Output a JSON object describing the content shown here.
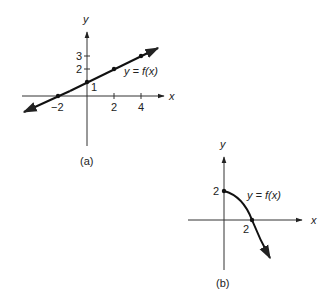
{
  "figure_a": {
    "caption": "(a)",
    "x_axis_label": "x",
    "y_axis_label": "y",
    "x_ticks": [
      "−2",
      "2",
      "4"
    ],
    "y_ticks": [
      "1",
      "2",
      "3"
    ],
    "curve_label": "y = f(x)",
    "points": [
      [
        -2,
        0
      ],
      [
        0,
        1
      ],
      [
        2,
        2
      ],
      [
        4,
        3
      ]
    ]
  },
  "figure_b": {
    "caption": "(b)",
    "x_axis_label": "x",
    "y_axis_label": "y",
    "x_tick": "2",
    "y_tick": "2",
    "curve_label": "y = f(x)",
    "points": [
      [
        0,
        2
      ],
      [
        2,
        0
      ]
    ]
  },
  "colors": {
    "ink": "#222222",
    "background": "#ffffff"
  }
}
